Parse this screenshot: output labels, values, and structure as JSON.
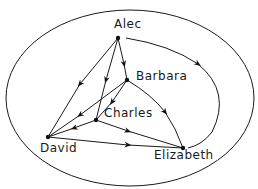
{
  "diagram": {
    "type": "directed-graph",
    "boundary": "ellipse",
    "nodes": [
      {
        "id": "alec",
        "label": "Alec"
      },
      {
        "id": "barbara",
        "label": "Barbara"
      },
      {
        "id": "charles",
        "label": "Charles"
      },
      {
        "id": "david",
        "label": "David"
      },
      {
        "id": "elizabeth",
        "label": "Elizabeth"
      }
    ],
    "edges": [
      {
        "from": "Alec",
        "to": "David"
      },
      {
        "from": "Alec",
        "to": "Charles"
      },
      {
        "from": "Alec",
        "to": "Barbara"
      },
      {
        "from": "Alec",
        "to": "Elizabeth"
      },
      {
        "from": "Barbara",
        "to": "David"
      },
      {
        "from": "Barbara",
        "to": "Charles"
      },
      {
        "from": "Barbara",
        "to": "Elizabeth"
      },
      {
        "from": "Charles",
        "to": "David"
      },
      {
        "from": "Charles",
        "to": "Elizabeth"
      },
      {
        "from": "David",
        "to": "Elizabeth"
      }
    ]
  }
}
